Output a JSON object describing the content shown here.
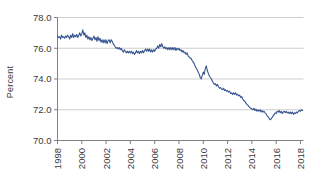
{
  "chart_data": {
    "type": "line",
    "title": "",
    "subtitle": "",
    "xlabel": "",
    "ylabel": "Percent",
    "xlim": [
      1998.0,
      2018.25
    ],
    "ylim": [
      70.0,
      78.0
    ],
    "grid": true,
    "legend": null,
    "legend_position": "none",
    "line_color": "#36548f",
    "y_ticks": [
      "70.0",
      "72.0",
      "74.0",
      "76.0",
      "78.0"
    ],
    "y_tick_values": [
      70.0,
      72.0,
      74.0,
      76.0,
      78.0
    ],
    "x_ticks": [
      "1998",
      "2000",
      "2002",
      "2004",
      "2006",
      "2008",
      "2010",
      "2012",
      "2014",
      "2016",
      "2018"
    ],
    "x_tick_values": [
      1998,
      2000,
      2002,
      2004,
      2006,
      2008,
      2010,
      2012,
      2014,
      2016,
      2018
    ],
    "series": [
      {
        "name": "Percent",
        "x": [
          1998.0,
          1998.08,
          1998.17,
          1998.25,
          1998.33,
          1998.42,
          1998.5,
          1998.58,
          1998.67,
          1998.75,
          1998.83,
          1998.92,
          1999.0,
          1999.08,
          1999.17,
          1999.25,
          1999.33,
          1999.42,
          1999.5,
          1999.58,
          1999.67,
          1999.75,
          1999.83,
          1999.92,
          2000.0,
          2000.08,
          2000.17,
          2000.25,
          2000.33,
          2000.42,
          2000.5,
          2000.58,
          2000.67,
          2000.75,
          2000.83,
          2000.92,
          2001.0,
          2001.08,
          2001.17,
          2001.25,
          2001.33,
          2001.42,
          2001.5,
          2001.58,
          2001.67,
          2001.75,
          2001.83,
          2001.92,
          2002.0,
          2002.08,
          2002.17,
          2002.25,
          2002.33,
          2002.42,
          2002.5,
          2002.58,
          2002.67,
          2002.75,
          2002.83,
          2002.92,
          2003.0,
          2003.08,
          2003.17,
          2003.25,
          2003.33,
          2003.42,
          2003.5,
          2003.58,
          2003.67,
          2003.75,
          2003.83,
          2003.92,
          2004.0,
          2004.08,
          2004.17,
          2004.25,
          2004.33,
          2004.42,
          2004.5,
          2004.58,
          2004.67,
          2004.75,
          2004.83,
          2004.92,
          2005.0,
          2005.08,
          2005.17,
          2005.25,
          2005.33,
          2005.42,
          2005.5,
          2005.58,
          2005.67,
          2005.75,
          2005.83,
          2005.92,
          2006.0,
          2006.08,
          2006.17,
          2006.25,
          2006.33,
          2006.42,
          2006.5,
          2006.58,
          2006.67,
          2006.75,
          2006.83,
          2006.92,
          2007.0,
          2007.08,
          2007.17,
          2007.25,
          2007.33,
          2007.42,
          2007.5,
          2007.58,
          2007.67,
          2007.75,
          2007.83,
          2007.92,
          2008.0,
          2008.08,
          2008.17,
          2008.25,
          2008.33,
          2008.42,
          2008.5,
          2008.58,
          2008.67,
          2008.75,
          2008.83,
          2008.92,
          2009.0,
          2009.08,
          2009.17,
          2009.25,
          2009.33,
          2009.42,
          2009.5,
          2009.58,
          2009.67,
          2009.75,
          2009.83,
          2009.92,
          2010.0,
          2010.08,
          2010.17,
          2010.25,
          2010.33,
          2010.42,
          2010.5,
          2010.58,
          2010.67,
          2010.75,
          2010.83,
          2010.92,
          2011.0,
          2011.08,
          2011.17,
          2011.25,
          2011.33,
          2011.42,
          2011.5,
          2011.58,
          2011.67,
          2011.75,
          2011.83,
          2011.92,
          2012.0,
          2012.08,
          2012.17,
          2012.25,
          2012.33,
          2012.42,
          2012.5,
          2012.58,
          2012.67,
          2012.75,
          2012.83,
          2012.92,
          2013.0,
          2013.08,
          2013.17,
          2013.25,
          2013.33,
          2013.42,
          2013.5,
          2013.58,
          2013.67,
          2013.75,
          2013.83,
          2013.92,
          2014.0,
          2014.08,
          2014.17,
          2014.25,
          2014.33,
          2014.42,
          2014.5,
          2014.58,
          2014.67,
          2014.75,
          2014.83,
          2014.92,
          2015.0,
          2015.08,
          2015.17,
          2015.25,
          2015.33,
          2015.42,
          2015.5,
          2015.58,
          2015.67,
          2015.75,
          2015.83,
          2015.92,
          2016.0,
          2016.08,
          2016.17,
          2016.25,
          2016.33,
          2016.42,
          2016.5,
          2016.58,
          2016.67,
          2016.75,
          2016.83,
          2016.92,
          2017.0,
          2017.08,
          2017.17,
          2017.25,
          2017.33,
          2017.42,
          2017.5,
          2017.58,
          2017.67,
          2017.75,
          2017.83,
          2017.92,
          2018.0,
          2018.08,
          2018.17
        ],
        "values": [
          76.8,
          76.7,
          76.75,
          76.6,
          76.85,
          76.7,
          76.75,
          76.65,
          76.8,
          76.7,
          76.85,
          76.75,
          76.6,
          76.85,
          76.7,
          76.95,
          76.7,
          76.85,
          76.75,
          76.9,
          76.7,
          76.85,
          77.0,
          76.8,
          76.95,
          77.2,
          76.85,
          77.0,
          76.7,
          76.85,
          76.6,
          76.75,
          76.55,
          76.7,
          76.5,
          76.65,
          76.8,
          76.55,
          76.7,
          76.45,
          76.75,
          76.5,
          76.65,
          76.4,
          76.55,
          76.35,
          76.55,
          76.35,
          76.55,
          76.3,
          76.5,
          76.55,
          76.35,
          76.55,
          76.45,
          76.3,
          76.2,
          76.1,
          76.0,
          76.05,
          75.95,
          76.05,
          75.9,
          76.0,
          75.85,
          75.75,
          75.9,
          75.8,
          75.7,
          75.8,
          75.7,
          75.8,
          75.7,
          75.8,
          75.65,
          75.75,
          75.6,
          75.7,
          75.85,
          75.7,
          75.8,
          75.65,
          75.8,
          75.7,
          75.85,
          75.7,
          75.85,
          75.95,
          75.8,
          75.95,
          75.8,
          75.95,
          75.75,
          75.9,
          75.75,
          75.9,
          75.8,
          75.95,
          76.0,
          76.15,
          76.0,
          76.25,
          76.1,
          76.3,
          76.1,
          76.0,
          76.1,
          75.95,
          76.05,
          75.9,
          76.05,
          75.9,
          76.05,
          75.9,
          76.05,
          75.9,
          76.05,
          75.85,
          76.0,
          75.9,
          76.0,
          75.85,
          75.9,
          75.75,
          75.85,
          75.7,
          75.75,
          75.6,
          75.7,
          75.5,
          75.45,
          75.35,
          75.35,
          75.2,
          75.1,
          75.0,
          74.85,
          74.7,
          74.6,
          74.45,
          74.3,
          74.1,
          74.0,
          74.25,
          74.45,
          74.3,
          74.7,
          74.85,
          74.55,
          74.35,
          74.2,
          74.1,
          74.0,
          73.85,
          73.75,
          73.65,
          73.7,
          73.55,
          73.65,
          73.5,
          73.4,
          73.45,
          73.35,
          73.3,
          73.4,
          73.25,
          73.3,
          73.2,
          73.25,
          73.15,
          73.2,
          73.05,
          73.1,
          73.0,
          73.1,
          73.0,
          73.1,
          72.95,
          73.0,
          72.9,
          72.95,
          72.8,
          72.85,
          72.7,
          72.6,
          72.55,
          72.45,
          72.35,
          72.3,
          72.2,
          72.15,
          72.1,
          72.05,
          72.0,
          72.1,
          71.95,
          72.05,
          71.9,
          72.0,
          71.9,
          72.0,
          71.85,
          71.95,
          71.85,
          71.9,
          71.8,
          71.75,
          71.6,
          71.55,
          71.45,
          71.35,
          71.4,
          71.5,
          71.6,
          71.7,
          71.8,
          71.75,
          71.9,
          71.85,
          71.95,
          71.8,
          71.9,
          71.75,
          71.85,
          71.9,
          71.8,
          71.9,
          71.8,
          71.85,
          71.75,
          71.85,
          71.75,
          71.85,
          71.7,
          71.8,
          71.75,
          71.85,
          71.8,
          71.9,
          71.95,
          71.9,
          72.0,
          71.95
        ]
      }
    ]
  }
}
